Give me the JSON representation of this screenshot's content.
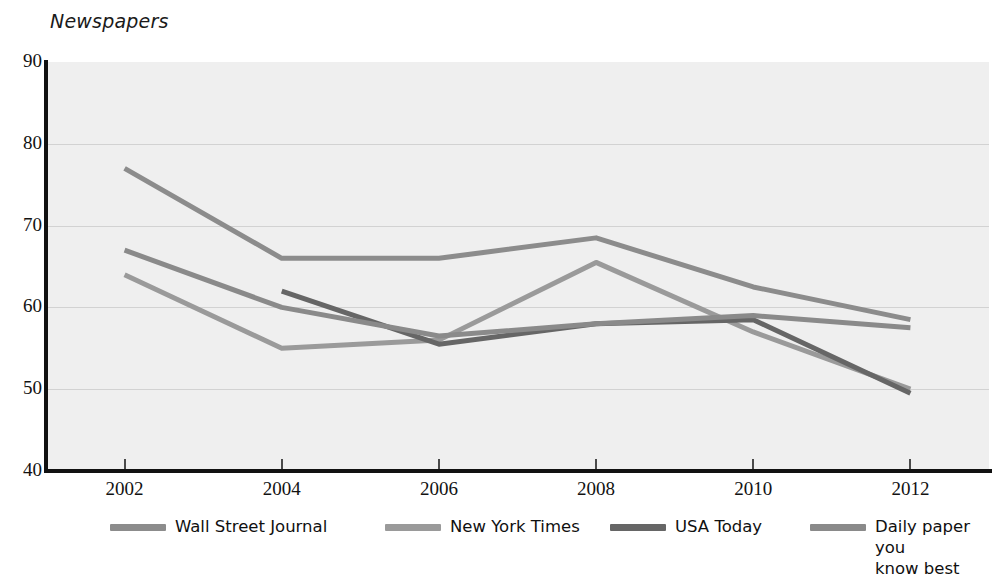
{
  "chart_data": {
    "type": "line",
    "title": "Newspapers",
    "xlabel": "",
    "ylabel": "",
    "x": [
      2002,
      2004,
      2006,
      2008,
      2010,
      2012
    ],
    "categories": [
      "2002",
      "2004",
      "2006",
      "2008",
      "2010",
      "2012"
    ],
    "xlim": [
      2001,
      2013
    ],
    "ylim": [
      40,
      90
    ],
    "yticks": [
      40,
      50,
      60,
      70,
      80,
      90
    ],
    "ytick_labels": [
      "40",
      "50",
      "60",
      "70",
      "80",
      "90"
    ],
    "xtick_labels": [
      "2002",
      "2004",
      "2006",
      "2008",
      "2010",
      "2012"
    ],
    "grid": true,
    "grid_axis": "y",
    "legend_position": "bottom",
    "plot_background": "#efefef",
    "series": [
      {
        "name": "Wall Street Journal",
        "color": "#8c8c8c",
        "x": [
          2002,
          2004,
          2006,
          2008,
          2010,
          2012
        ],
        "values": [
          77,
          66,
          66,
          68.5,
          62.5,
          58.5
        ]
      },
      {
        "name": "New York Times",
        "color": "#9a9a9a",
        "x": [
          2002,
          2004,
          2006,
          2008,
          2010,
          2012
        ],
        "values": [
          64,
          55,
          56,
          65.5,
          57,
          50
        ]
      },
      {
        "name": "USA Today",
        "color": "#666666",
        "x": [
          2004,
          2006,
          2008,
          2010,
          2012
        ],
        "values": [
          62,
          55.5,
          58,
          58.5,
          49.5
        ]
      },
      {
        "name": "Daily paper you know best",
        "color": "#8a8a8a",
        "x": [
          2002,
          2004,
          2006,
          2008,
          2010,
          2012
        ],
        "values": [
          67,
          60,
          56.5,
          58,
          59,
          57.5
        ]
      }
    ]
  },
  "legend": {
    "items": [
      {
        "label": "Wall Street Journal",
        "color": "#8c8c8c"
      },
      {
        "label": "New York Times",
        "color": "#9a9a9a"
      },
      {
        "label": "USA Today",
        "color": "#666666"
      },
      {
        "label": "Daily paper you\nknow best",
        "color": "#8a8a8a"
      }
    ]
  }
}
